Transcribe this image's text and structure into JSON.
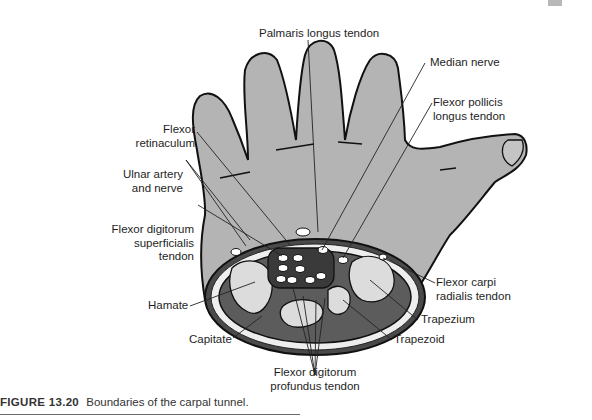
{
  "figure": {
    "caption_number": "FIGURE 13.20",
    "caption_text": "Boundaries of the carpal tunnel.",
    "colors": {
      "hand_fill": "#b4b4b4",
      "outline": "#111111",
      "bone_fill": "#dcdcdc",
      "tunnel_fill": "#5a5a5a",
      "retinaculum_fill": "#f2f2f2"
    },
    "labels": {
      "palmaris_longus": "Palmaris longus tendon",
      "median_nerve": "Median nerve",
      "fpl_line1": "Flexor pollicis",
      "fpl_line2": "longus tendon",
      "retinaculum_line1": "Flexor",
      "retinaculum_line2": "retinaculum",
      "ulnar_line1": "Ulnar artery",
      "ulnar_line2": "and nerve",
      "fds_line1": "Flexor digitorum",
      "fds_line2": "superficialis",
      "fds_line3": "tendon",
      "hamate": "Hamate",
      "capitate": "Capitate",
      "fdp_line1": "Flexor digitorum",
      "fdp_line2": "profundus tendon",
      "fcr_line1": "Flexor carpi",
      "fcr_line2": "radialis tendon",
      "trapezium": "Trapezium",
      "trapezoid": "Trapezoid"
    }
  }
}
